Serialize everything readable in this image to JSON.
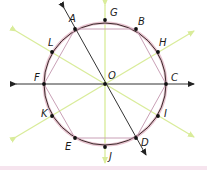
{
  "diagram": {
    "type": "circle-with-inscribed-hexagon-and-symmetry-axes",
    "center": {
      "label": "O",
      "x": 105,
      "y": 84
    },
    "radius": 61,
    "colors": {
      "circle": "#3a2a2a",
      "hexagon": "#c9a0b6",
      "circle_fill_ring": "#e7c3cf",
      "main_lines": "#333333",
      "symmetry_axes": "#d9ec9a",
      "points": "#111111",
      "footer_band": "#f6e4ee"
    },
    "points": [
      {
        "label": "A",
        "x": 75,
        "y": 29,
        "lx": 69,
        "ly": 22
      },
      {
        "label": "B",
        "x": 136,
        "y": 29,
        "lx": 138,
        "ly": 25
      },
      {
        "label": "C",
        "x": 166,
        "y": 84,
        "lx": 171,
        "ly": 81
      },
      {
        "label": "D",
        "x": 136,
        "y": 138,
        "lx": 141,
        "ly": 146
      },
      {
        "label": "E",
        "x": 75,
        "y": 138,
        "lx": 65,
        "ly": 150
      },
      {
        "label": "F",
        "x": 44,
        "y": 84,
        "lx": 34,
        "ly": 81
      },
      {
        "label": "G",
        "x": 105,
        "y": 20,
        "lx": 110,
        "ly": 16
      },
      {
        "label": "H",
        "x": 158,
        "y": 52,
        "lx": 159,
        "ly": 46
      },
      {
        "label": "I",
        "x": 158,
        "y": 116,
        "lx": 164,
        "ly": 117
      },
      {
        "label": "J",
        "x": 105,
        "y": 147,
        "lx": 109,
        "ly": 160
      },
      {
        "label": "K",
        "x": 52,
        "y": 116,
        "lx": 41,
        "ly": 117
      },
      {
        "label": "L",
        "x": 52,
        "y": 52,
        "lx": 48,
        "ly": 46
      },
      {
        "label": "O",
        "x": 105,
        "y": 84,
        "lx": 108,
        "ly": 79
      }
    ],
    "lines": [
      {
        "name": "horizontal-axis-line",
        "through": [
          "F",
          "O",
          "C"
        ],
        "arrows": "both"
      },
      {
        "name": "diagonal-line-AD",
        "through": [
          "A",
          "O",
          "D"
        ],
        "arrows": "both"
      }
    ],
    "symmetry_axes": [
      {
        "name": "vertical-axis-GJ",
        "through": [
          "G",
          "O",
          "J"
        ]
      },
      {
        "name": "axis-LI",
        "through": [
          "L",
          "O",
          "I"
        ]
      },
      {
        "name": "axis-KH",
        "through": [
          "K",
          "O",
          "H"
        ]
      }
    ],
    "polygon": [
      "A",
      "B",
      "C",
      "D",
      "E",
      "F"
    ]
  }
}
